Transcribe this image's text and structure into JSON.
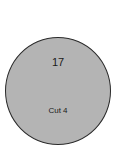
{
  "node": {
    "number": "17",
    "label": "Cut 4",
    "fill_color": "#b4b4b4",
    "stroke_color": "#2a2a2a"
  }
}
